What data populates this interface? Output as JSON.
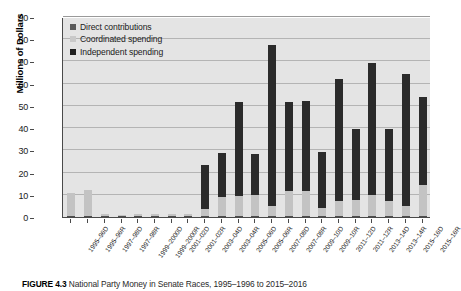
{
  "figure": {
    "caption_label": "FIGURE 4.3",
    "caption_text": "National Party Money in Senate Races, 1995–1996 to 2015–2016"
  },
  "legend": {
    "position": "top-left",
    "items": [
      {
        "label": "Direct contributions",
        "color": "#5a5a5a",
        "key": "direct"
      },
      {
        "label": "Coordinated spending",
        "color": "#c9c9c9",
        "key": "coordinated"
      },
      {
        "label": "Independent spending",
        "color": "#1f1f1f",
        "key": "independent"
      }
    ]
  },
  "chart_data": {
    "type": "bar",
    "stacked": true,
    "title": "",
    "xlabel": "",
    "ylabel": "Millions of Dollars",
    "ylim": [
      0,
      90
    ],
    "ytick_step": 10,
    "yticks": [
      0,
      10,
      20,
      30,
      40,
      50,
      60,
      70,
      80,
      90
    ],
    "grid": true,
    "legend_position": "top-left",
    "categories": [
      "1995–96D",
      "1995–96R",
      "1997–98D",
      "1997–98R",
      "1999–2000D",
      "1999–2000R",
      "2001–02D",
      "2001–02R",
      "2003–04D",
      "2003–04R",
      "2005–06D",
      "2005–06R",
      "2007–08D",
      "2007–08R",
      "2009–10D",
      "2009–10R",
      "2011–12D",
      "2011–12R",
      "2013–14D",
      "2013–14R",
      "2015–16D",
      "2015–16R"
    ],
    "series": [
      {
        "name": "Direct contributions",
        "color": "#4d4d4d",
        "values": [
          0.6,
          0.6,
          0.3,
          0.3,
          0.3,
          0.3,
          0.3,
          0.3,
          0.4,
          0.4,
          0.4,
          0.4,
          0.5,
          0.5,
          0.5,
          0.5,
          0.5,
          0.5,
          0.5,
          0.5,
          0.5,
          0.5
        ]
      },
      {
        "name": "Coordinated spending",
        "color": "#c3c3c3",
        "values": [
          10.4,
          11.4,
          0.7,
          0.5,
          1.0,
          1.0,
          1.0,
          0.9,
          3.3,
          8.7,
          9.0,
          9.4,
          4.3,
          11.3,
          11.2,
          3.6,
          6.8,
          7.1,
          9.2,
          6.6,
          4.3,
          14.0
        ]
      },
      {
        "name": "Independent spending",
        "color": "#2b2b2b",
        "values": [
          0,
          0,
          0,
          0,
          0,
          0,
          0,
          0,
          19.8,
          19.8,
          42.5,
          18.5,
          72.5,
          40.0,
          40.5,
          25.0,
          55.0,
          32.0,
          59.5,
          32.5,
          59.5,
          39.5
        ]
      }
    ],
    "totals": [
      11,
      12,
      1,
      0.8,
      1.3,
      1.3,
      1.3,
      1.2,
      23.5,
      28.9,
      51.9,
      28.3,
      77.3,
      51.8,
      52.2,
      29.1,
      62.3,
      39.6,
      69.2,
      39.6,
      64.3,
      54.0
    ]
  }
}
